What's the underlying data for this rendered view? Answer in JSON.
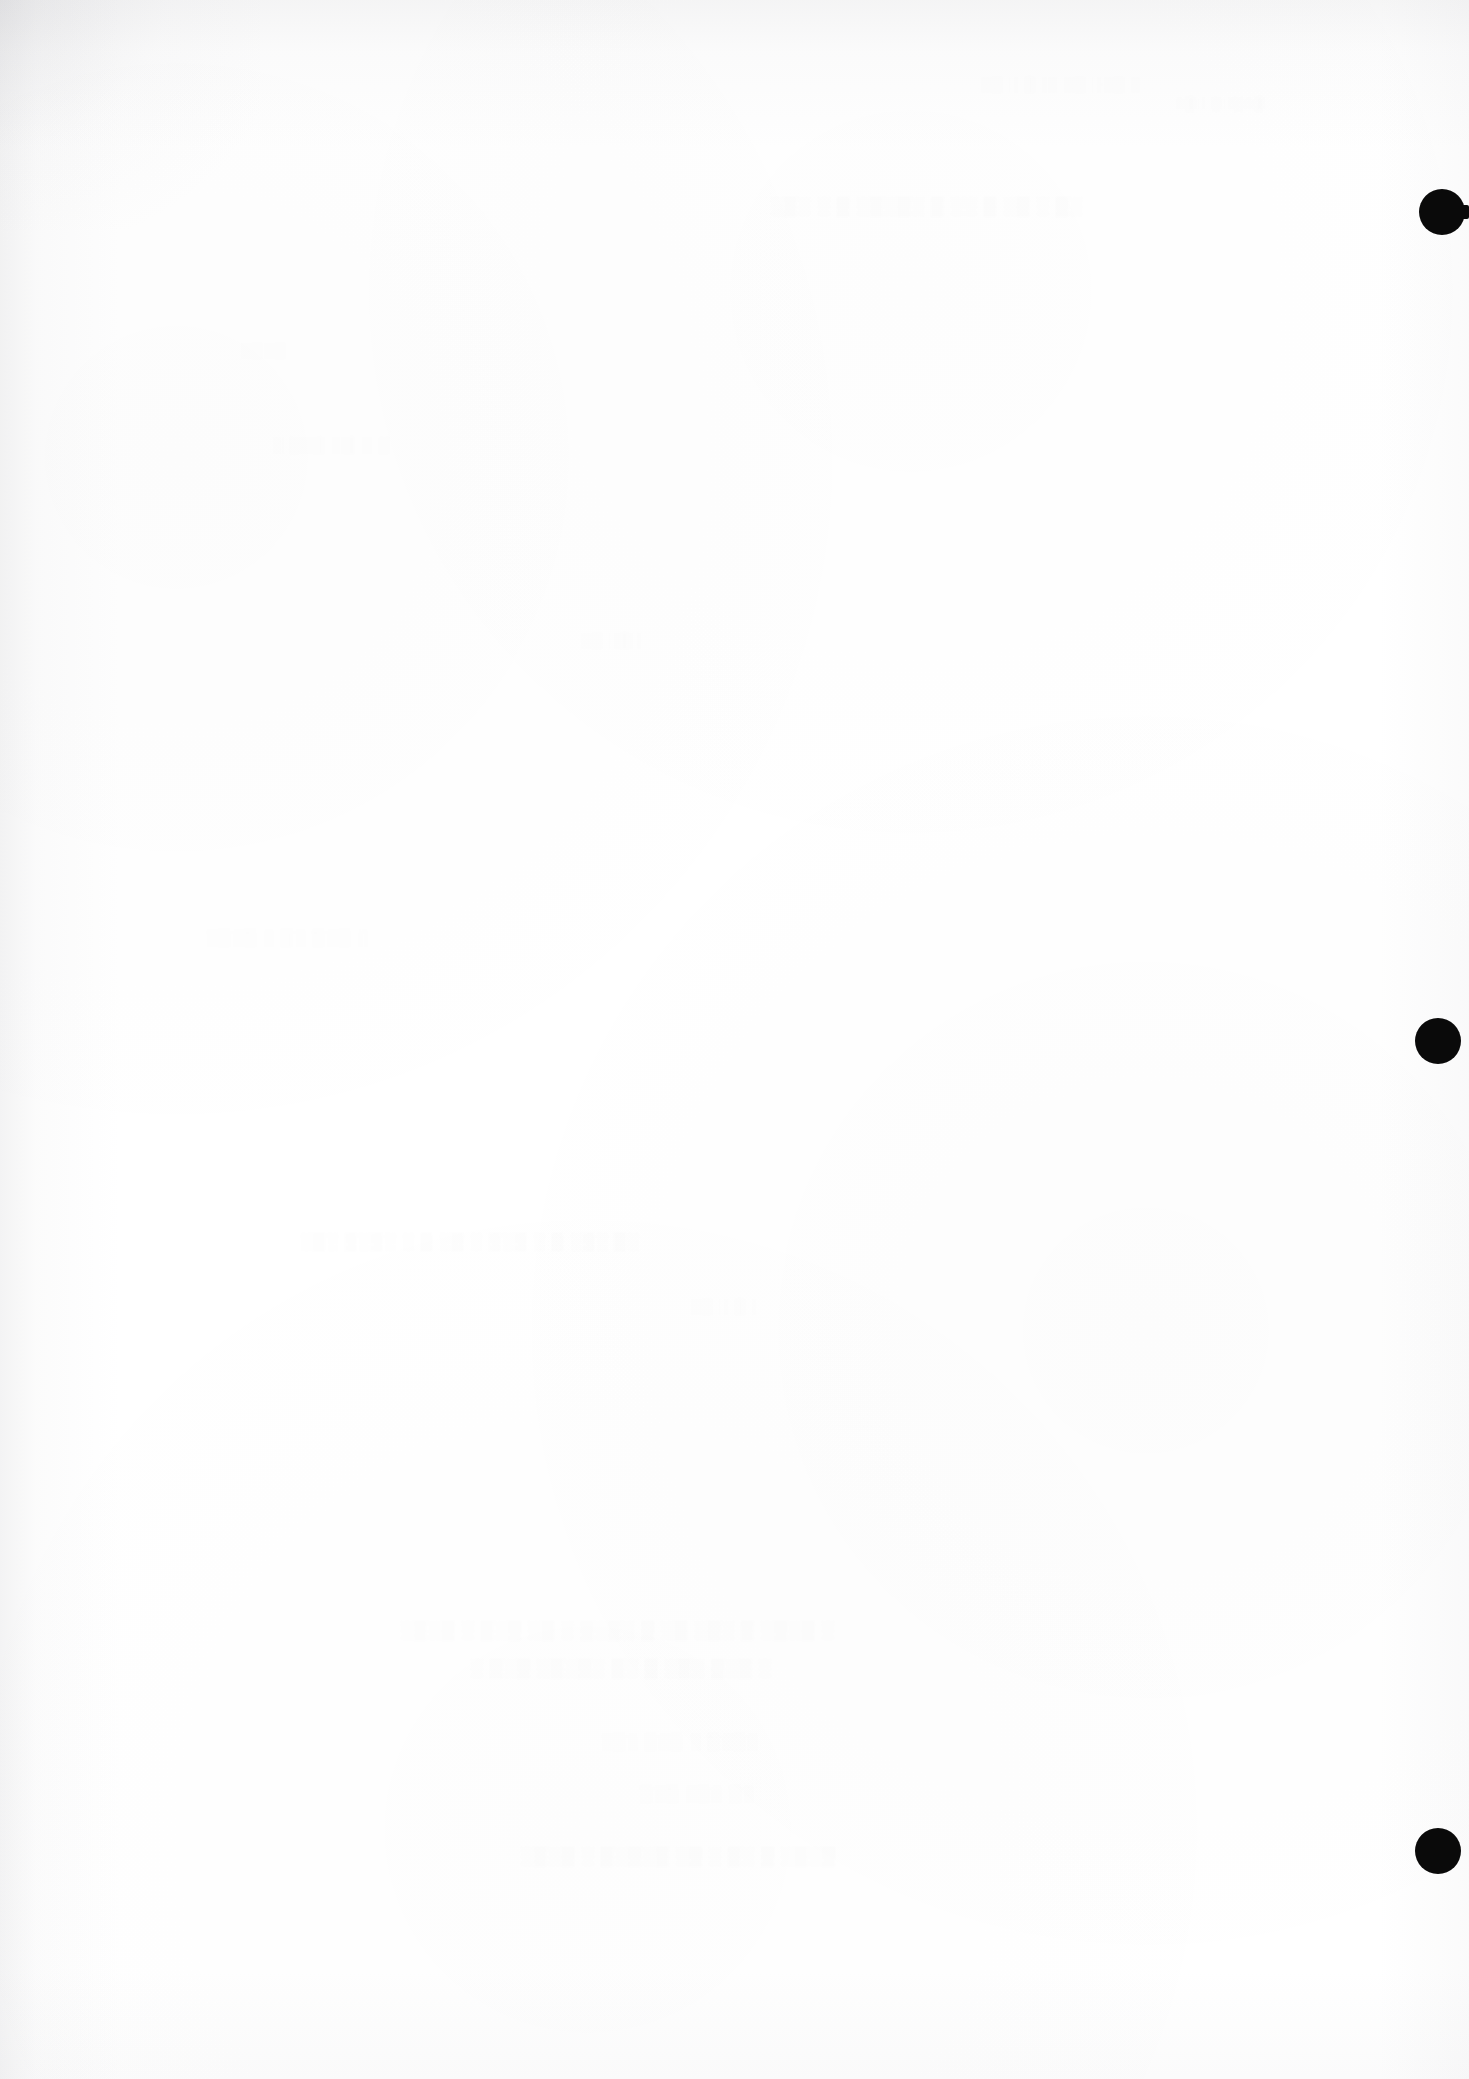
{
  "page": {
    "kind": "scanned-page",
    "background_color": "#ffffff",
    "width": 1469,
    "height": 2079,
    "legible_text": "",
    "note": "No legible text is present on this page."
  },
  "register_marks": {
    "label": "register-punch-dots",
    "color": "#0a0a0a",
    "count": 3,
    "dots": [
      {
        "name": "register-dot-top",
        "cx": 1442,
        "cy": 212,
        "r": 23,
        "has_tail": true
      },
      {
        "name": "register-dot-middle",
        "cx": 1438,
        "cy": 1041,
        "r": 23,
        "has_tail": false
      },
      {
        "name": "register-dot-bottom",
        "cx": 1438,
        "cy": 1851,
        "r": 23,
        "has_tail": false
      }
    ]
  },
  "bleedthrough": {
    "label": "show-through-ghost-text",
    "legible": false,
    "opacity_note": "approximately 1-2% ink density; illegible at 3x magnification",
    "bands": [
      {
        "name": "ghost-band-1",
        "x": 980,
        "y": 76,
        "size": 15,
        "width": 420,
        "weight": "fainter",
        "glyphs": "░▒ ░ ▒░░ ░▒ ░░▒ ░"
      },
      {
        "name": "ghost-band-2",
        "x": 1175,
        "y": 96,
        "size": 14,
        "width": 200,
        "weight": "fainter",
        "glyphs": "░▒░ ▒░▒░▒"
      },
      {
        "name": "ghost-band-3",
        "x": 770,
        "y": 196,
        "size": 18,
        "width": 560,
        "weight": "faint",
        "glyphs": "░▒░ ░ ▒ ░▒░▒░ ▒ ░░ ▒ ░▒ ░ ▒░"
      },
      {
        "name": "ghost-band-4",
        "x": 240,
        "y": 342,
        "size": 15,
        "width": 130,
        "weight": "fainter",
        "glyphs": "░▒░▒"
      },
      {
        "name": "ghost-band-5",
        "x": 272,
        "y": 436,
        "size": 16,
        "width": 300,
        "weight": "fainter",
        "glyphs": "░ ▒░▒ ░▒ ░ ▒"
      },
      {
        "name": "ghost-band-6",
        "x": 580,
        "y": 632,
        "size": 15,
        "width": 160,
        "weight": "fainter",
        "glyphs": "░▒ ░▒░"
      },
      {
        "name": "ghost-band-7",
        "x": 205,
        "y": 928,
        "size": 17,
        "width": 400,
        "weight": "fainter",
        "glyphs": "░▒░▒ ░ ▒░ ▒░▒ ░"
      },
      {
        "name": "ghost-band-8",
        "x": 300,
        "y": 1232,
        "size": 17,
        "width": 760,
        "weight": "faint",
        "glyphs": "░▒░ ▒░▒░ ░ ▒ ░▒ ░ ▒░▒ ░ ▒ ░▒░ ▒░"
      },
      {
        "name": "ghost-band-9",
        "x": 690,
        "y": 1298,
        "size": 15,
        "width": 260,
        "weight": "fainter",
        "glyphs": "░▒ ░ ▒░"
      },
      {
        "name": "ghost-band-10",
        "x": 400,
        "y": 1620,
        "size": 18,
        "width": 860,
        "weight": "faint",
        "glyphs": "░▒░▒ ░ ▒░▒ ░▒ ░ ▒░▒░ ▒ ░▒ ░▒░ ▒ ░▒░▒ ░"
      },
      {
        "name": "ghost-band-11",
        "x": 470,
        "y": 1658,
        "size": 18,
        "width": 700,
        "weight": "faint",
        "glyphs": "░ ▒░▒ ░▒░▒░ ▒░ ▒ ░▒░ ▒░▒ ░"
      },
      {
        "name": "ghost-band-12",
        "x": 600,
        "y": 1732,
        "size": 17,
        "width": 430,
        "weight": "fainter",
        "glyphs": "░▒░ ▒░▒ ░ ▒░▒░"
      },
      {
        "name": "ghost-band-13",
        "x": 640,
        "y": 1784,
        "size": 17,
        "width": 330,
        "weight": "fainter",
        "glyphs": "▒░▒ ░▒░ ▒░"
      },
      {
        "name": "ghost-band-14",
        "x": 520,
        "y": 1846,
        "size": 18,
        "width": 720,
        "weight": "faint",
        "glyphs": "░▒░▒ ░ ▒░▒░▒ ░▒ ░ ▒░ ▒ ░▒░▒"
      }
    ]
  }
}
